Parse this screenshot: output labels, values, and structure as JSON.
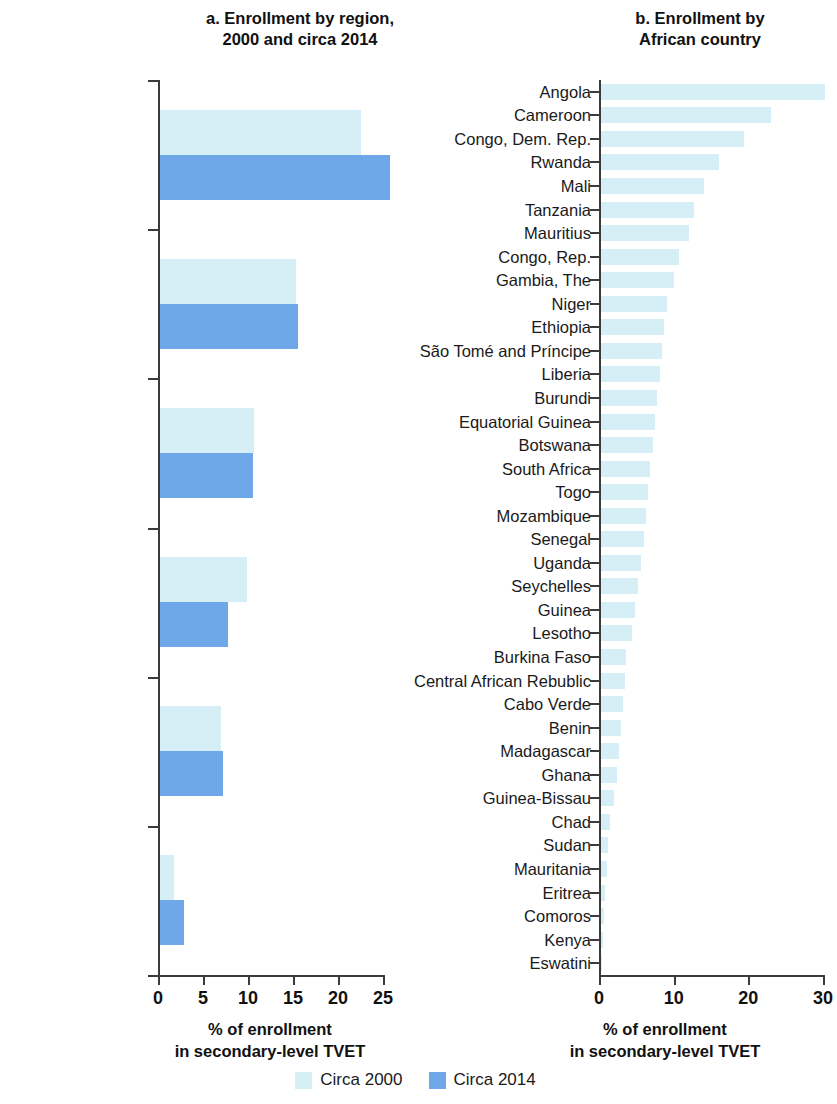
{
  "figure": {
    "panel_a_title": "a. Enrollment by region,\n2000 and circa 2014",
    "panel_a_title_line1": "a. Enrollment by region,",
    "panel_a_title_line2": "2000 and circa 2014",
    "panel_b_title_line1": "b. Enrollment by",
    "panel_b_title_line2": "African country",
    "axis_title_line1": "% of enrollment",
    "axis_title_line2": "in secondary-level TVET"
  },
  "legend": {
    "position": "bottom-center",
    "items": [
      {
        "label": "Circa 2000",
        "color": "#d6eff7"
      },
      {
        "label": "Circa 2014",
        "color": "#6fa8e8"
      }
    ]
  },
  "colors": {
    "circa_2000": "#d6eff7",
    "circa_2014": "#6fa8e8",
    "axis": "#3b3b3b",
    "text": "#1a1a1a"
  },
  "chart_data": [
    {
      "type": "bar",
      "orientation": "horizontal",
      "title": "a. Enrollment by region, 2000 and circa 2014",
      "xlabel": "% of enrollment in secondary-level TVET",
      "ylabel": "",
      "xlim": [
        0,
        25
      ],
      "xticks": [
        0,
        5,
        10,
        15,
        20,
        25
      ],
      "grid": false,
      "legend": [
        "Circa 2000",
        "Circa 2014"
      ],
      "categories": [
        "Europe and Certral Asia",
        "Latin America and the Caribbean",
        "East Asia and Pacific",
        "Middle East and North Africa",
        "Sub-Saharan Africa",
        "South Asia"
      ],
      "categories_lines": [
        [
          "Europe and",
          "Certral Asia"
        ],
        [
          "Latin America and",
          "the Caribbean"
        ],
        [
          "East Asia",
          "and Pacific"
        ],
        [
          "Middle East and",
          "North Africa"
        ],
        [
          "Sub-Saharan",
          "Africa"
        ],
        [
          "South Asia"
        ]
      ],
      "series": [
        {
          "name": "Circa 2000",
          "values": [
            22.3,
            15.1,
            10.4,
            9.7,
            6.8,
            1.6
          ]
        },
        {
          "name": "Circa 2014",
          "values": [
            25.6,
            15.3,
            10.3,
            7.6,
            7.0,
            2.7
          ]
        }
      ]
    },
    {
      "type": "bar",
      "orientation": "horizontal",
      "title": "b. Enrollment by African country",
      "xlabel": "% of enrollment in secondary-level TVET",
      "ylabel": "",
      "xlim": [
        0,
        30
      ],
      "xticks": [
        0,
        10,
        20,
        30
      ],
      "grid": false,
      "legend": [
        "Circa 2000"
      ],
      "categories": [
        "Angola",
        "Cameroon",
        "Congo, Dem. Rep.",
        "Rwanda",
        "Mali",
        "Tanzania",
        "Mauritius",
        "Congo, Rep.",
        "Gambia, The",
        "Niger",
        "Ethiopia",
        "São Tomé and Príncipe",
        "Liberia",
        "Burundi",
        "Equatorial Guinea",
        "Botswana",
        "South Africa",
        "Togo",
        "Mozambique",
        "Senegal",
        "Uganda",
        "Seychelles",
        "Guinea",
        "Lesotho",
        "Burkina Faso",
        "Central African Rebublic",
        "Cabo Verde",
        "Benin",
        "Madagascar",
        "Ghana",
        "Guinea-Bissau",
        "Chad",
        "Sudan",
        "Mauritania",
        "Eritrea",
        "Comoros",
        "Kenya",
        "Eswatini"
      ],
      "values": [
        30.0,
        22.8,
        19.2,
        15.8,
        13.8,
        12.5,
        11.8,
        10.5,
        9.8,
        8.8,
        8.5,
        8.2,
        7.9,
        7.5,
        7.2,
        6.9,
        6.6,
        6.3,
        6.0,
        5.7,
        5.3,
        4.9,
        4.5,
        4.2,
        3.4,
        3.2,
        3.0,
        2.7,
        2.4,
        2.2,
        1.7,
        1.2,
        1.0,
        0.8,
        0.6,
        0.4,
        0.25,
        0.1
      ]
    }
  ]
}
